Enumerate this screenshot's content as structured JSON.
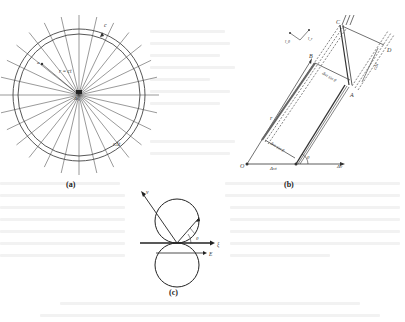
{
  "figure": {
    "panels": [
      {
        "id": "a",
        "caption": "(a)",
        "labels": {
          "speed": "c",
          "radius": "r = ct",
          "point": "a",
          "origin": "Δt₀",
          "shell_thickness": "cΔt"
        }
      },
      {
        "id": "b",
        "caption": "(b)",
        "labels": {
          "O": "O",
          "A": "A",
          "B": "B",
          "C": "C",
          "D": "D",
          "r": "r",
          "dt_upper": "Δvt sin θ",
          "dt_lower": "Δvt sin θ",
          "dv_right": "Δv",
          "dv_base": "Δvt",
          "theta": "θ",
          "cdt": "cΔt",
          "axis_r": "î_r",
          "axis_theta": "î_θ"
        }
      },
      {
        "id": "c",
        "caption": "(c)",
        "labels": {
          "v": "v",
          "theta": "θ",
          "xi": "ξ",
          "E": "E"
        }
      }
    ]
  }
}
